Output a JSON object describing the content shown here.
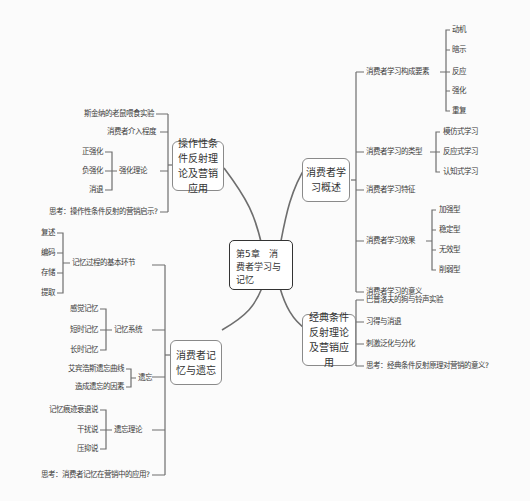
{
  "center": {
    "title": "第5章　消费者学习与记忆"
  },
  "branches": {
    "operant": {
      "title": "操作性条件反射理论及营销应用",
      "items": [
        {
          "label": "斯金纳的老鼠喂食实验"
        },
        {
          "label": "消费者介入程度"
        },
        {
          "label": "强化理论",
          "children": [
            "正强化",
            "负强化",
            "消退"
          ]
        },
        {
          "label": "思考：操作性条件反射的营销启示?"
        }
      ]
    },
    "memory": {
      "title": "消费者记忆与遗忘",
      "items": [
        {
          "label": "记忆过程的基本环节",
          "children": [
            "复述",
            "编码",
            "存储",
            "提取"
          ]
        },
        {
          "label": "记忆系统",
          "children": [
            "感觉记忆",
            "短时记忆",
            "长时记忆"
          ]
        },
        {
          "label": "遗忘",
          "children": [
            "艾宾浩斯遗忘曲线",
            "造成遗忘的因素"
          ]
        },
        {
          "label": "遗忘理论",
          "children": [
            "记忆痕迹衰退说",
            "干扰说",
            "压抑说"
          ]
        },
        {
          "label": "思考：消费者记忆在营销中的应用?"
        }
      ]
    },
    "learning": {
      "title": "消费者学习概述",
      "items": [
        {
          "label": "消费者学习构成要素",
          "children": [
            "动机",
            "暗示",
            "反应",
            "强化",
            "重复"
          ]
        },
        {
          "label": "消费者学习的类型",
          "children": [
            "模仿式学习",
            "反应式学习",
            "认知式学习"
          ]
        },
        {
          "label": "消费者学习特征"
        },
        {
          "label": "消费者学习效果",
          "children": [
            "加强型",
            "稳定型",
            "无效型",
            "削弱型"
          ]
        },
        {
          "label": "消费者学习的意义"
        }
      ]
    },
    "classical": {
      "title": "经典条件反射理论及营销应用",
      "items": [
        {
          "label": "巴普洛夫的狗与铃声实验"
        },
        {
          "label": "习得与消退"
        },
        {
          "label": "刺激泛化与分化"
        },
        {
          "label": "思考：经典条件反射原理对营销的意义?"
        }
      ]
    }
  },
  "colors": {
    "line": "#6e6e6e",
    "node_border": "#8a8a8a",
    "center_border": "#333333",
    "background": "#fbfbfb"
  }
}
